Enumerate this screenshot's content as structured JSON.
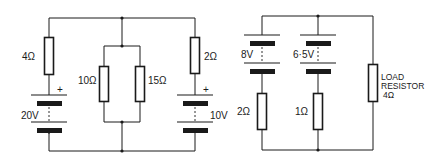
{
  "diagram": {
    "title": "",
    "circuits": [
      {
        "id": "left-circuit",
        "description": "20V source with 4Ω series resistor, parallel 10Ω and 15Ω network, 10V source with 2Ω series resistor",
        "components": {
          "r4": {
            "type": "resistor",
            "label": "4Ω"
          },
          "battery20": {
            "type": "battery",
            "label": "20V",
            "polarity": "+"
          },
          "r10": {
            "type": "resistor",
            "label": "10Ω"
          },
          "r15": {
            "type": "resistor",
            "label": "15Ω"
          },
          "r2": {
            "type": "resistor",
            "label": "2Ω"
          },
          "battery10": {
            "type": "battery",
            "label": "10V",
            "polarity": "+"
          }
        }
      },
      {
        "id": "right-circuit",
        "description": "8V and 6.5V sources with internal resistances 2Ω and 1Ω in parallel, feeding a 4Ω load resistor",
        "components": {
          "battery8": {
            "type": "battery",
            "label": "8V"
          },
          "battery65": {
            "type": "battery",
            "label": "6·5V"
          },
          "r2b": {
            "type": "resistor",
            "label": "2Ω"
          },
          "r1": {
            "type": "resistor",
            "label": "1Ω"
          },
          "load": {
            "type": "resistor",
            "label_line1": "LOAD",
            "label_line2": "RESISTOR",
            "label_line3": "4Ω"
          }
        }
      }
    ],
    "colors": {
      "line": "#1a1a1a",
      "background": "#ffffff"
    }
  }
}
